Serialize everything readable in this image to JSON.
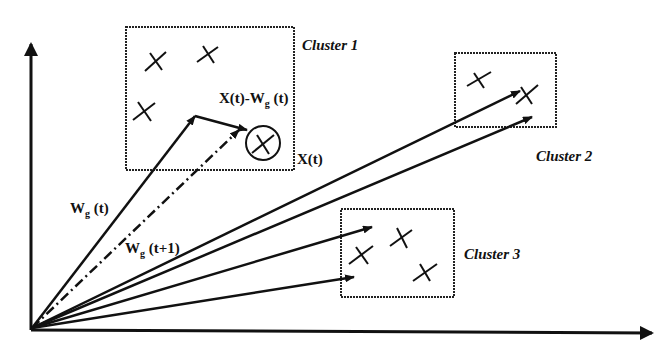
{
  "clusters": [
    {
      "label": "Cluster 1"
    },
    {
      "label": "Cluster 2"
    },
    {
      "label": "Cluster 3"
    }
  ],
  "vectors": {
    "wg_t": {
      "main": "W",
      "sub": "g",
      "tail": " (t)"
    },
    "wg_t1": {
      "main": "W",
      "sub": "g",
      "tail": " (t+1)"
    },
    "diff": {
      "pre": "X(t)-W",
      "sub": "g",
      "tail": " (t)"
    },
    "xt": "X(t)"
  },
  "colors": {
    "stroke": "#111111",
    "background": "#ffffff"
  }
}
